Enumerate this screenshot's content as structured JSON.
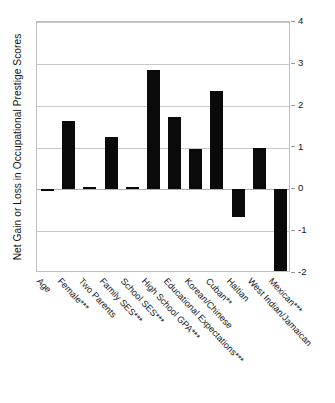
{
  "chart_data": {
    "type": "bar",
    "title": "",
    "xlabel": "",
    "ylabel": "Net Gain or Loss in Occupational Prestige Scores",
    "ylim": [
      -2,
      4
    ],
    "yticks": [
      4,
      3,
      2,
      1,
      0,
      -1,
      -2
    ],
    "ytick_labels": [
      "4",
      "3",
      "2",
      "1",
      "0",
      "-1",
      "-2"
    ],
    "grid": true,
    "legend": "none",
    "bar_color": "#0a0a0a",
    "categories": [
      "Age",
      "Female***",
      "Two Parents",
      "Family SES***",
      "School SES***",
      "High School GPA***",
      "Educational Expectations***",
      "Korean/Chinese",
      "Cuban**",
      "Haitian",
      "West Indian/Jamaican",
      "Mexican***"
    ],
    "values": [
      -0.05,
      1.63,
      0.06,
      1.25,
      0.06,
      2.85,
      1.72,
      0.97,
      2.34,
      -0.65,
      0.98,
      -2.0
    ]
  },
  "axis": {
    "ylabel_text": "Net Gain or Loss in Occupational Prestige Scores"
  }
}
